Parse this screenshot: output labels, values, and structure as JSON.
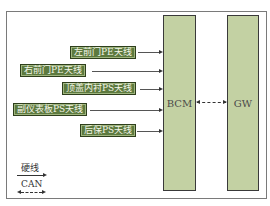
{
  "diagram": {
    "type": "block-diagram",
    "modules": {
      "bcm": {
        "label": "BCM"
      },
      "gw": {
        "label": "GW"
      }
    },
    "antennas": [
      {
        "label": "左前门PE天线"
      },
      {
        "label": "右前门PE天线"
      },
      {
        "label": "顶盖内衬PS天线"
      },
      {
        "label": "副仪表板PS天线"
      },
      {
        "label": "后保PS天线"
      }
    ],
    "connections": [
      {
        "from": "左前门PE天线",
        "to": "BCM",
        "type": "硬线"
      },
      {
        "from": "右前门PE天线",
        "to": "BCM",
        "type": "硬线"
      },
      {
        "from": "顶盖内衬PS天线",
        "to": "BCM",
        "type": "硬线"
      },
      {
        "from": "副仪表板PS天线",
        "to": "BCM",
        "type": "硬线"
      },
      {
        "from": "后保PS天线",
        "to": "BCM",
        "type": "硬线"
      },
      {
        "from": "BCM",
        "to": "GW",
        "type": "CAN",
        "bidirectional": true
      }
    ],
    "legend": {
      "hardwire_label": "硬线",
      "can_label": "CAN"
    },
    "colors": {
      "module_fill": "#c3d1a3",
      "antenna_fill": "#5d7a3f",
      "antenna_text": "#f3f6e8",
      "line": "#555555"
    }
  }
}
